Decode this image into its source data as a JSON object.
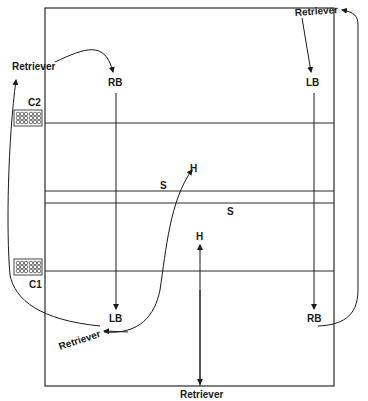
{
  "diagram": {
    "type": "court-positions",
    "line_color": "#2a2a2a",
    "labels": {
      "retriever_top_left": "Retriever",
      "retriever_top_right": "Retriever",
      "retriever_bottom_left": "Retriever",
      "retriever_bottom": "Retriever",
      "rb_top": "RB",
      "lb_top_right": "LB",
      "lb_bottom": "LB",
      "rb_bottom_right": "RB",
      "h_upper": "H",
      "h_lower": "H",
      "s_left": "S",
      "s_right": "S",
      "c1": "C1",
      "c2": "C2"
    }
  }
}
